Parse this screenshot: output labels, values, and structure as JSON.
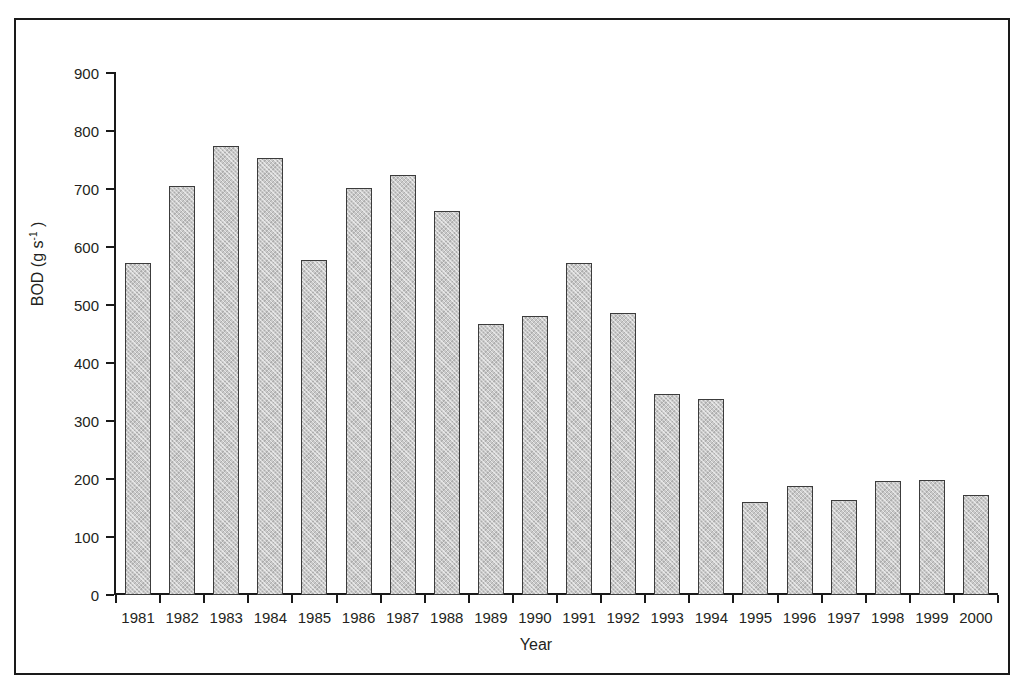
{
  "figure": {
    "frame_color": "#1a1a1a",
    "background": "#ffffff",
    "caption": ""
  },
  "chart_data": {
    "type": "bar",
    "title": "",
    "subtitle": "",
    "xlabel": "Year",
    "ylabel": "BOD (g s-1)",
    "ylabel_base": "BOD (g s",
    "ylabel_exponent": "-1",
    "ylabel_tail": " )",
    "categories": [
      "1981",
      "1982",
      "1983",
      "1984",
      "1985",
      "1986",
      "1987",
      "1988",
      "1989",
      "1990",
      "1991",
      "1992",
      "1993",
      "1994",
      "1995",
      "1996",
      "1997",
      "1998",
      "1999",
      "2000"
    ],
    "values": [
      573,
      705,
      774,
      754,
      578,
      701,
      725,
      662,
      468,
      481,
      573,
      486,
      346,
      338,
      161,
      188,
      164,
      197,
      199,
      173
    ],
    "ylim": [
      0,
      900
    ],
    "ytick_values": [
      0,
      100,
      200,
      300,
      400,
      500,
      600,
      700,
      800,
      900
    ],
    "ytick_labels": [
      "0",
      "100",
      "200",
      "300",
      "400",
      "500",
      "600",
      "700",
      "800",
      "900"
    ],
    "grid": false,
    "legend": null,
    "bar_fill_color": "#c9c9c9",
    "bar_edge_color": "#3c3c3c",
    "bar_pattern": "cross-hatch"
  }
}
